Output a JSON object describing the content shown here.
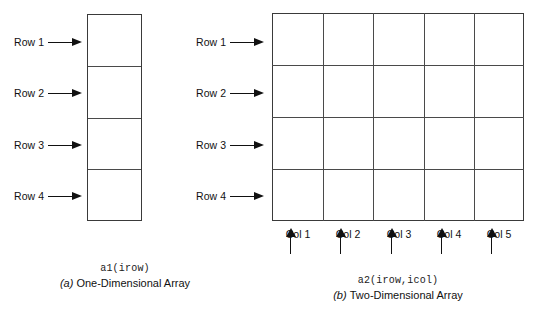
{
  "figure": {
    "panels": [
      {
        "id": "one-dimensional",
        "row_labels": [
          "Row 1",
          "Row 2",
          "Row 3",
          "Row 4"
        ],
        "col_labels": [],
        "rows": 4,
        "cols": 1,
        "caption_code": "a1(irow)",
        "caption_tag": "(a)",
        "caption_text": "One-Dimensional Array"
      },
      {
        "id": "two-dimensional",
        "row_labels": [
          "Row 1",
          "Row 2",
          "Row 3",
          "Row 4"
        ],
        "col_labels": [
          "Col 1",
          "Col 2",
          "Col 3",
          "Col 4",
          "Col 5"
        ],
        "rows": 4,
        "cols": 5,
        "caption_code": "a2(irow,icol)",
        "caption_tag": "(b)",
        "caption_text": "Two-Dimensional Array"
      }
    ],
    "colors": {
      "background": "#ffffff",
      "line": "#3a3a3a",
      "inner_line": "#4a4a4a",
      "text": "#111111"
    }
  }
}
